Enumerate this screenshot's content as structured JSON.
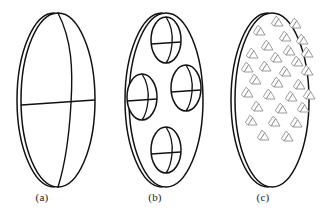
{
  "figure": {
    "background_color": "#ffffff",
    "line_color": "#111111",
    "wedge_color": "#8a8a8a",
    "width": 326,
    "height": 216
  },
  "panels": [
    {
      "id": "a",
      "label": "(a)",
      "description": "plain disc with single meridian arc and horizontal chord",
      "disc": {
        "cx": 58,
        "cy": 100,
        "rx": 37,
        "ry": 87,
        "rim_offset": 5
      },
      "meridian": {
        "bulge": 14
      },
      "chord": {
        "y": 103
      },
      "features": []
    },
    {
      "id": "b",
      "label": "(b)",
      "description": "disc containing four small ellipses each with meridian arc and chord",
      "disc": {
        "cx": 58,
        "cy": 100,
        "rx": 37,
        "ry": 87,
        "rim_offset": 5
      },
      "features": [
        {
          "cx": 58,
          "cy": 40,
          "rx": 15,
          "ry": 23,
          "bulge": 6,
          "chord_y": 44
        },
        {
          "cx": 34,
          "cy": 97,
          "rx": 15,
          "ry": 23,
          "bulge": 6,
          "chord_y": 101
        },
        {
          "cx": 78,
          "cy": 88,
          "rx": 15,
          "ry": 23,
          "bulge": 6,
          "chord_y": 92
        },
        {
          "cx": 58,
          "cy": 150,
          "rx": 15,
          "ry": 23,
          "bulge": 6,
          "chord_y": 154
        }
      ]
    },
    {
      "id": "c",
      "label": "(c)",
      "description": "disc filled with many small triangular wedge shapes",
      "disc": {
        "cx": 56,
        "cy": 100,
        "rx": 37,
        "ry": 87,
        "rim_offset": 5
      },
      "wedge_count": 29,
      "wedge_size": 9,
      "wedges": [
        {
          "x": 58,
          "y": 26
        },
        {
          "x": 76,
          "y": 28
        },
        {
          "x": 40,
          "y": 35
        },
        {
          "x": 66,
          "y": 41
        },
        {
          "x": 83,
          "y": 44
        },
        {
          "x": 48,
          "y": 50
        },
        {
          "x": 70,
          "y": 55
        },
        {
          "x": 88,
          "y": 57
        },
        {
          "x": 33,
          "y": 58
        },
        {
          "x": 57,
          "y": 62
        },
        {
          "x": 78,
          "y": 66
        },
        {
          "x": 28,
          "y": 72
        },
        {
          "x": 46,
          "y": 71
        },
        {
          "x": 66,
          "y": 76
        },
        {
          "x": 88,
          "y": 75
        },
        {
          "x": 36,
          "y": 84
        },
        {
          "x": 58,
          "y": 87
        },
        {
          "x": 80,
          "y": 89
        },
        {
          "x": 28,
          "y": 97
        },
        {
          "x": 50,
          "y": 99
        },
        {
          "x": 72,
          "y": 101
        },
        {
          "x": 90,
          "y": 99
        },
        {
          "x": 38,
          "y": 111
        },
        {
          "x": 62,
          "y": 113
        },
        {
          "x": 84,
          "y": 112
        },
        {
          "x": 32,
          "y": 125
        },
        {
          "x": 55,
          "y": 126
        },
        {
          "x": 77,
          "y": 127
        },
        {
          "x": 44,
          "y": 140
        },
        {
          "x": 68,
          "y": 141
        }
      ]
    }
  ]
}
